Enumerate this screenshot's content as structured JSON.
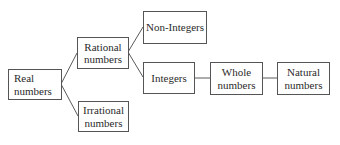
{
  "diagram": {
    "type": "tree",
    "nodes": {
      "real": {
        "line1": "Real",
        "line2": "numbers"
      },
      "rational": {
        "line1": "Rational",
        "line2": "numbers"
      },
      "irrational": {
        "line1": "Irrational",
        "line2": "numbers"
      },
      "non_integers": {
        "line1": "Non-Integers"
      },
      "integers": {
        "line1": "Integers"
      },
      "whole": {
        "line1": "Whole",
        "line2": "numbers"
      },
      "natural": {
        "line1": "Natural",
        "line2": "numbers"
      }
    },
    "edges": [
      {
        "from": "Real numbers",
        "to": "Rational numbers"
      },
      {
        "from": "Real numbers",
        "to": "Irrational numbers"
      },
      {
        "from": "Rational numbers",
        "to": "Non-Integers"
      },
      {
        "from": "Rational numbers",
        "to": "Integers"
      },
      {
        "from": "Integers",
        "to": "Whole numbers"
      },
      {
        "from": "Whole numbers",
        "to": "Natural numbers"
      }
    ],
    "colors": {
      "border": "#555555",
      "line": "#5a5a5a",
      "text": "#2a2a2a",
      "background": "#ffffff"
    }
  }
}
